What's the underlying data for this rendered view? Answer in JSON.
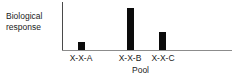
{
  "chart_data": {
    "type": "bar",
    "title": "",
    "subtitle": "",
    "categories": [
      "X-X-A",
      "X-X-B",
      "X-X-C"
    ],
    "values": [
      8,
      42,
      18
    ],
    "xlabel": "Pool",
    "ylabel": "Biological response",
    "ylabel_line1": "Biological",
    "ylabel_line2": "response",
    "ylim": [
      0,
      49
    ],
    "xlim_note": "categorical",
    "grid": false,
    "legend": false,
    "legend_position": "none",
    "bar_color": "#0b0b0b",
    "axis_color": "#4a4a4a",
    "baseline_color": "#8c8c8c",
    "text_color": "#1b1b1b",
    "background_color": "#ffffff",
    "y_ticks": [],
    "y_tick_labels": [],
    "annotations": [],
    "bars": [
      {
        "category": "X-X-A",
        "value": 8,
        "center_pct": 11.2,
        "width_px": 7,
        "height_px": 8
      },
      {
        "category": "X-X-B",
        "value": 42,
        "center_pct": 40.0,
        "width_px": 7,
        "height_px": 42
      },
      {
        "category": "X-X-C",
        "value": 18,
        "center_pct": 59.4,
        "width_px": 7,
        "height_px": 18
      }
    ]
  }
}
